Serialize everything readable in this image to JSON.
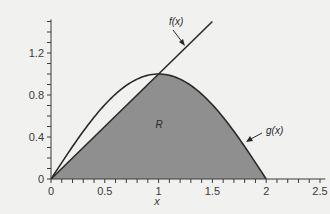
{
  "chart_data": {
    "type": "area",
    "title": "",
    "xlabel": "x",
    "ylabel": "",
    "xlim": [
      0,
      2.6
    ],
    "ylim": [
      0,
      1.5
    ],
    "x_ticks": [
      0,
      0.5,
      1,
      1.5,
      2,
      2.5
    ],
    "x_tick_labels": [
      "0",
      "0.5",
      "1",
      "1.5",
      "2",
      "2.5"
    ],
    "y_ticks": [
      0,
      0.4,
      0.8,
      1.2
    ],
    "y_tick_labels": [
      "0",
      "0.4",
      "0.8",
      "1.2"
    ],
    "grid": false,
    "series": [
      {
        "name": "f(x)",
        "kind": "line",
        "x": [
          0,
          0.25,
          0.5,
          0.75,
          1,
          1.25,
          1.5
        ],
        "values": [
          0,
          0.25,
          0.5,
          0.75,
          1,
          1.25,
          1.5
        ]
      },
      {
        "name": "g(x)",
        "kind": "curve",
        "x": [
          0,
          0.25,
          0.5,
          0.75,
          1,
          1.25,
          1.5,
          1.75,
          2
        ],
        "values": [
          0,
          0.38,
          0.71,
          0.92,
          1,
          0.92,
          0.71,
          0.38,
          0
        ]
      }
    ],
    "shaded_region": {
      "label": "R",
      "description": "Region under min(f(x), g(x)) from x=0 to x=2",
      "x_range": [
        0,
        2
      ],
      "color": "#8f8f8f"
    },
    "annotations": [
      {
        "text": "f(x)",
        "points_to": "f(x) line near x=1.3"
      },
      {
        "text": "g(x)",
        "points_to": "g(x) curve near x=1.75"
      },
      {
        "text": "R",
        "position": [
          1,
          0.5
        ]
      }
    ],
    "colors": {
      "background": "#f1f1ef",
      "shade": "#8f8f8f",
      "line": "#2a2a2a",
      "axis": "#3a3a3a"
    }
  }
}
